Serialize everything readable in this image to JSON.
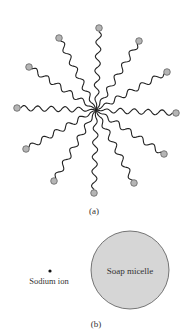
{
  "figure": {
    "panel_a": {
      "label": "(a)",
      "center": [
        96,
        110
      ],
      "heads": [
        [
          99,
          28
        ],
        [
          139,
          41
        ],
        [
          167,
          72
        ],
        [
          176,
          113
        ],
        [
          164,
          154
        ],
        [
          134,
          183
        ],
        [
          94,
          193
        ],
        [
          54,
          181
        ],
        [
          26,
          149
        ],
        [
          17,
          108
        ],
        [
          29,
          67
        ],
        [
          59,
          38
        ]
      ],
      "head_color": "#b5b5b5",
      "tail_color": "#222222"
    },
    "panel_b": {
      "label": "(b)",
      "sodium_label": "Sodium ion",
      "micelle_label": "Soap micelle",
      "micelle_color": "#d6d6d6"
    }
  }
}
